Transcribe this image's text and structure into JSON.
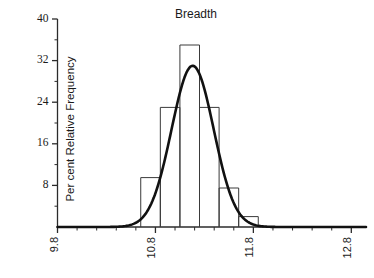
{
  "chart_data": {
    "type": "bar",
    "title": "Breadth",
    "subtitle": "",
    "xlabel": "",
    "ylabel": "Per cent Relative Frequency",
    "xlim": [
      9.8,
      12.95
    ],
    "ylim": [
      0,
      40
    ],
    "grid": false,
    "legend": null,
    "x_tick_labels": [
      "9.8",
      "10.8",
      "11.8",
      "12.8"
    ],
    "x_tick_values": [
      9.8,
      10.8,
      11.8,
      12.8
    ],
    "x_minor_tick_values": [
      10.0,
      10.2,
      10.4,
      10.6,
      11.0,
      11.2,
      11.4,
      11.6,
      12.0,
      12.2,
      12.4,
      12.6
    ],
    "y_tick_labels": [
      "8",
      "16",
      "24",
      "32",
      "40"
    ],
    "y_tick_values": [
      8,
      16,
      24,
      32,
      40
    ],
    "y_minor_tick_values": [
      4,
      12,
      20,
      28,
      36
    ],
    "bin_edges": [
      10.65,
      10.85,
      11.05,
      11.25,
      11.45,
      11.65,
      11.85
    ],
    "categories": [
      "10.65-10.85",
      "10.85-11.05",
      "11.05-11.25",
      "11.25-11.45",
      "11.45-11.65",
      "11.65-11.85"
    ],
    "values": [
      9.5,
      23.0,
      35.0,
      23.0,
      7.5,
      2.0
    ],
    "overlay_curve": {
      "name": "fitted normal curve",
      "type": "line",
      "mean": 11.18,
      "sigma": 0.215,
      "peak_value": 31.0
    },
    "colors": {
      "bar_outline": "#3a3a3a",
      "curve": "#111111",
      "axis": "#2b2b2b",
      "text": "#1a1a1a",
      "background": "#ffffff"
    }
  }
}
